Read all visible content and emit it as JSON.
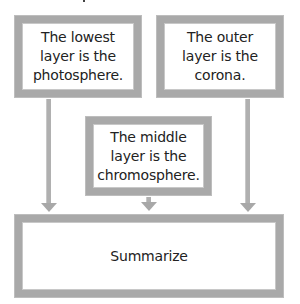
{
  "diagram": {
    "type": "flowchart-summary",
    "boxes": [
      {
        "id": "lowest",
        "text": "The lowest layer is the photosphere."
      },
      {
        "id": "outer",
        "text": "The outer layer is the corona."
      },
      {
        "id": "middle",
        "text": "The middle layer is the chromosphere."
      },
      {
        "id": "summary",
        "text": "Summarize"
      }
    ],
    "edges": [
      {
        "from": "lowest",
        "to": "summary"
      },
      {
        "from": "middle",
        "to": "summary"
      },
      {
        "from": "outer",
        "to": "summary"
      }
    ],
    "colors": {
      "border": "#a9a9a9",
      "arrow": "#a8a8a8",
      "background": "#ffffff"
    }
  }
}
